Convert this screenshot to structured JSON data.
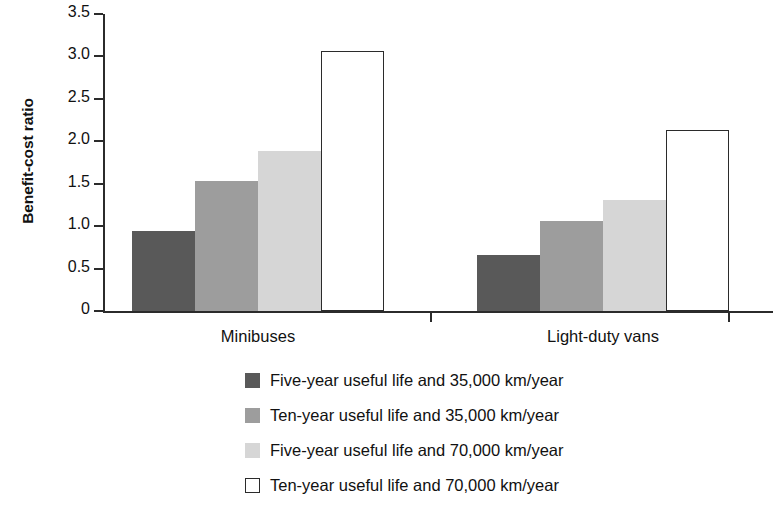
{
  "chart_data": {
    "type": "bar",
    "title": "",
    "xlabel": "",
    "ylabel": "Benefit-cost ratio",
    "ylim": [
      0,
      3.5
    ],
    "ytick_values": [
      3.5,
      3.0,
      2.5,
      2.0,
      1.5,
      1.0,
      0.5,
      0
    ],
    "ytick_labels": [
      "3.5",
      "3.0",
      "2.5",
      "2.0",
      "1.5",
      "1.0",
      "0.5",
      "0"
    ],
    "grid": false,
    "legend_position": "bottom",
    "categories": [
      "Minibuses",
      "Light-duty vans"
    ],
    "series": [
      {
        "name": "Five-year useful life and 35,000 km/year",
        "color": "#595959",
        "style": "filled",
        "values": [
          0.94,
          0.66
        ]
      },
      {
        "name": "Ten-year useful life and 35,000 km/year",
        "color": "#9d9d9d",
        "style": "filled",
        "values": [
          1.53,
          1.06
        ]
      },
      {
        "name": "Five-year useful life and 70,000 km/year",
        "color": "#d6d6d6",
        "style": "filled",
        "values": [
          1.89,
          1.31
        ]
      },
      {
        "name": "Ten-year useful life and 70,000 km/year",
        "color": "#ffffff",
        "style": "outline",
        "values": [
          3.07,
          2.13
        ]
      }
    ]
  },
  "axis": {
    "label_y": "Benefit-cost ratio"
  },
  "legend": {
    "items": [
      {
        "label": "Five-year useful life and 35,000 km/year",
        "swatch": "#595959",
        "outline": false
      },
      {
        "label": "Ten-year useful life and 35,000 km/year",
        "swatch": "#9d9d9d",
        "outline": false
      },
      {
        "label": "Five-year useful life and 70,000 km/year",
        "swatch": "#d6d6d6",
        "outline": false
      },
      {
        "label": "Ten-year useful life and 70,000 km/year",
        "swatch": "#ffffff",
        "outline": true
      }
    ]
  }
}
